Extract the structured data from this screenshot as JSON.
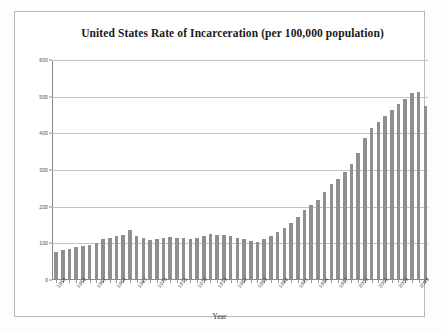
{
  "chart_data": {
    "type": "bar",
    "title": "United States Rate of Incarceration (per 100,000 population)",
    "xlabel": "Year",
    "ylabel": "",
    "ylim": [
      0,
      600
    ],
    "yticks": [
      0,
      100,
      200,
      300,
      400,
      500,
      600
    ],
    "grid": true,
    "legend": null,
    "bar_color": "#8f8f8f",
    "categories": [
      "1955",
      "1956",
      "1957",
      "1958",
      "1959",
      "1960",
      "1961",
      "1962",
      "1963",
      "1964",
      "1965",
      "1966",
      "1967",
      "1968",
      "1969",
      "1970",
      "1971",
      "1972",
      "1973",
      "1974",
      "1975",
      "1976",
      "1977",
      "1978",
      "1979",
      "1980",
      "1981",
      "1982",
      "1983",
      "1984",
      "1985",
      "1986",
      "1987",
      "1988",
      "1989",
      "1990",
      "1991",
      "1992",
      "1993",
      "1994",
      "1995",
      "1996",
      "1997",
      "1998",
      "1999",
      "2000",
      "2001",
      "2002",
      "2003",
      "2004",
      "2005",
      "2006",
      "2007",
      "2008",
      "2009",
      "2010"
    ],
    "values": [
      74,
      78,
      81,
      86,
      89,
      93,
      98,
      108,
      113,
      116,
      119,
      135,
      118,
      113,
      107,
      110,
      112,
      115,
      113,
      111,
      109,
      113,
      118,
      122,
      121,
      119,
      117,
      112,
      108,
      104,
      102,
      108,
      117,
      128,
      139,
      153,
      170,
      188,
      202,
      216,
      238,
      258,
      273,
      292,
      313,
      344,
      385,
      411,
      427,
      445,
      461,
      476,
      491,
      506,
      509,
      471
    ],
    "xtick_labels": [
      {
        "year": "1955",
        "index": 0
      },
      {
        "year": "1958",
        "index": 3
      },
      {
        "year": "1961",
        "index": 6
      },
      {
        "year": "1964",
        "index": 9
      },
      {
        "year": "1967",
        "index": 12
      },
      {
        "year": "1970",
        "index": 15
      },
      {
        "year": "1973",
        "index": 18
      },
      {
        "year": "1976",
        "index": 21
      },
      {
        "year": "1979",
        "index": 24
      },
      {
        "year": "1982",
        "index": 27
      },
      {
        "year": "1985",
        "index": 30
      },
      {
        "year": "1988",
        "index": 33
      },
      {
        "year": "1991",
        "index": 36
      },
      {
        "year": "1994",
        "index": 39
      },
      {
        "year": "1997",
        "index": 42
      },
      {
        "year": "2000",
        "index": 45
      },
      {
        "year": "2003",
        "index": 48
      },
      {
        "year": "2006",
        "index": 51
      },
      {
        "year": "2009",
        "index": 54
      }
    ]
  }
}
